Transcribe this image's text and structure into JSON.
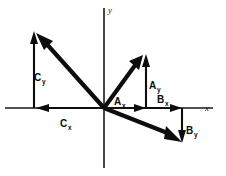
{
  "figure": {
    "background_color": "#ffffff",
    "ink_color": "#0d0d0d",
    "width": 226,
    "height": 176
  },
  "axes": {
    "x_label": "x",
    "y_label": "y",
    "origin": {
      "x": 104,
      "y": 108
    },
    "x_range_px": [
      5,
      213
    ],
    "y_range_px": [
      8,
      168
    ]
  },
  "vectors": [
    {
      "name": "A",
      "quadrant": "first",
      "direction": "up-right",
      "tip": {
        "x": 143,
        "y": 55
      },
      "components": [
        {
          "label": "A",
          "subscript": "x",
          "axis": "x",
          "sign": "positive",
          "label_pos": {
            "x": 117,
            "y": 103
          },
          "arrow_from": {
            "x": 104,
            "y": 108
          },
          "arrow_to": {
            "x": 146,
            "y": 108
          }
        },
        {
          "label": "A",
          "subscript": "y",
          "axis": "y",
          "sign": "positive",
          "label_pos": {
            "x": 150,
            "y": 86
          },
          "arrow_from": {
            "x": 146,
            "y": 108
          },
          "arrow_to": {
            "x": 146,
            "y": 57
          }
        }
      ]
    },
    {
      "name": "B",
      "quadrant": "fourth",
      "direction": "down-right",
      "tip": {
        "x": 182,
        "y": 142
      },
      "components": [
        {
          "label": "B",
          "subscript": "x",
          "axis": "x",
          "sign": "positive",
          "label_pos": {
            "x": 160,
            "y": 101
          },
          "arrow_from": {
            "x": 104,
            "y": 108
          },
          "arrow_to": {
            "x": 182,
            "y": 108
          }
        },
        {
          "label": "B",
          "subscript": "y",
          "axis": "y",
          "sign": "negative",
          "label_pos": {
            "x": 186,
            "y": 135
          },
          "arrow_from": {
            "x": 182,
            "y": 108
          },
          "arrow_to": {
            "x": 182,
            "y": 141
          }
        }
      ]
    },
    {
      "name": "C",
      "quadrant": "second",
      "direction": "up-left",
      "tip": {
        "x": 36,
        "y": 33
      },
      "components": [
        {
          "label": "C",
          "subscript": "x",
          "axis": "x",
          "sign": "negative",
          "label_pos": {
            "x": 63,
            "y": 124
          },
          "arrow_from": {
            "x": 104,
            "y": 108
          },
          "arrow_to": {
            "x": 37,
            "y": 108
          }
        },
        {
          "label": "C",
          "subscript": "y",
          "axis": "y",
          "sign": "positive",
          "label_pos": {
            "x": 38,
            "y": 77
          },
          "arrow_from": {
            "x": 34,
            "y": 108
          },
          "arrow_to": {
            "x": 34,
            "y": 34
          }
        }
      ]
    }
  ]
}
